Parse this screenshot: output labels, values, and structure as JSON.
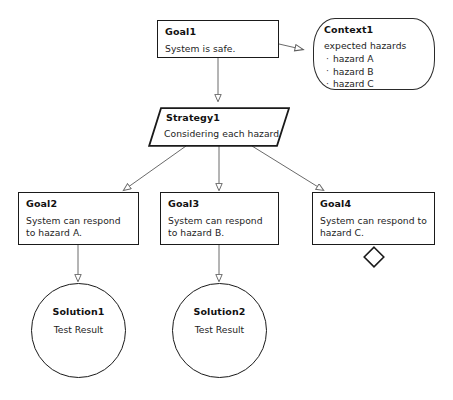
{
  "diagram": {
    "kind": "gsn-assurance-case",
    "background": "#ffffff",
    "line_color": "#555555",
    "border_color": "#1a1a1a"
  },
  "nodes": {
    "goal1": {
      "title": "Goal1",
      "body": "System is safe."
    },
    "context1": {
      "title": "Context1",
      "body": "expected hazards",
      "items": [
        "hazard A",
        "hazard B",
        "hazard C"
      ]
    },
    "strategy1": {
      "title": "Strategy1",
      "body": "Considering each hazard"
    },
    "goal2": {
      "title": "Goal2",
      "body": "System can respond to hazard A."
    },
    "goal3": {
      "title": "Goal3",
      "body": "System can respond to hazard B."
    },
    "goal4": {
      "title": "Goal4",
      "body": "System can respond to hazard C."
    },
    "solution1": {
      "title": "Solution1",
      "body": "Test Result"
    },
    "solution2": {
      "title": "Solution2",
      "body": "Test Result"
    },
    "undeveloped1": {
      "title": "undeveloped-diamond"
    }
  },
  "edges": [
    {
      "from": "goal1",
      "to": "context1",
      "kind": "in-context-of",
      "arrow": "hollow"
    },
    {
      "from": "goal1",
      "to": "strategy1",
      "kind": "supported-by",
      "arrow": "solid"
    },
    {
      "from": "strategy1",
      "to": "goal2",
      "kind": "supported-by",
      "arrow": "solid"
    },
    {
      "from": "strategy1",
      "to": "goal3",
      "kind": "supported-by",
      "arrow": "solid"
    },
    {
      "from": "strategy1",
      "to": "goal4",
      "kind": "supported-by",
      "arrow": "solid"
    },
    {
      "from": "goal2",
      "to": "solution1",
      "kind": "supported-by",
      "arrow": "solid"
    },
    {
      "from": "goal3",
      "to": "solution2",
      "kind": "supported-by",
      "arrow": "solid"
    }
  ]
}
